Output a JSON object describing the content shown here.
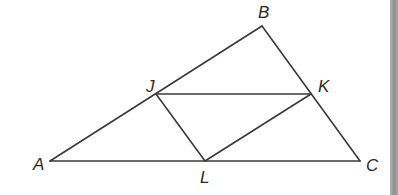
{
  "diagram": {
    "type": "geometry-triangle",
    "colors": {
      "stroke": "#3a3a3a",
      "label": "#2a2a2a",
      "background": "#ffffff",
      "side_bar": "#9a9a9a"
    },
    "points": {
      "A": {
        "label": "A",
        "x": 50,
        "y": 161,
        "lx": 33,
        "ly": 170
      },
      "B": {
        "label": "B",
        "x": 262,
        "y": 26,
        "lx": 258,
        "ly": 18
      },
      "C": {
        "label": "C",
        "x": 360,
        "y": 161,
        "lx": 366,
        "ly": 171
      },
      "J": {
        "label": "J",
        "x": 156,
        "y": 94,
        "lx": 146,
        "ly": 92
      },
      "K": {
        "label": "K",
        "x": 311,
        "y": 94,
        "lx": 318,
        "ly": 92
      },
      "L": {
        "label": "L",
        "x": 205,
        "y": 161,
        "lx": 200,
        "ly": 183
      }
    },
    "segments": [
      {
        "name": "segment-AB",
        "from": "A",
        "to": "B"
      },
      {
        "name": "segment-BC",
        "from": "B",
        "to": "C"
      },
      {
        "name": "segment-AC",
        "from": "A",
        "to": "C"
      },
      {
        "name": "segment-JK",
        "from": "J",
        "to": "K"
      },
      {
        "name": "segment-JL",
        "from": "J",
        "to": "L"
      },
      {
        "name": "segment-KL",
        "from": "K",
        "to": "L"
      }
    ]
  }
}
